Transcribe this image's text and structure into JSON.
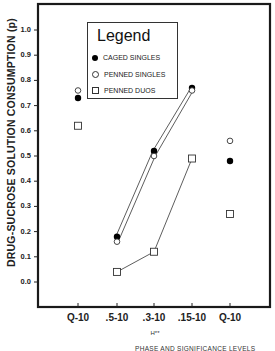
{
  "chart_data": {
    "type": "line",
    "title": "",
    "ylabel": "DRUG-SUCROSE SOLUTION CONSUMPTION (p)",
    "xlabel": "PHASE AND SIGNIFICANCE LEVELS",
    "x_sublabel": "H**",
    "categories": [
      "Q-10",
      ".5-10",
      ".3-10",
      ".15-10",
      "Q-10"
    ],
    "yticks": [
      "0.0",
      "0.1",
      "0.2",
      "0.3",
      "0.4",
      "0.5",
      "0.6",
      "0.7",
      "0.8",
      "0.9",
      "1.0"
    ],
    "ylim": [
      -0.1,
      1.05
    ],
    "grid": false,
    "legend": {
      "title": "Legend",
      "position": "upper-left-inside",
      "entries": [
        "CAGED SINGLES",
        "PENNED SINGLES",
        "PENNED DUOS"
      ]
    },
    "series": [
      {
        "name": "CAGED SINGLES",
        "marker": "filled-circle",
        "values": [
          0.73,
          0.18,
          0.52,
          0.77,
          0.48
        ],
        "connected_indices": [
          1,
          2,
          3
        ]
      },
      {
        "name": "PENNED SINGLES",
        "marker": "open-circle",
        "values": [
          0.76,
          0.16,
          0.5,
          0.76,
          0.56
        ],
        "connected_indices": [
          1,
          2,
          3
        ]
      },
      {
        "name": "PENNED DUOS",
        "marker": "open-square",
        "values": [
          0.62,
          0.04,
          0.12,
          0.49,
          0.27
        ],
        "connected_indices": [
          1,
          2,
          3
        ]
      }
    ]
  }
}
